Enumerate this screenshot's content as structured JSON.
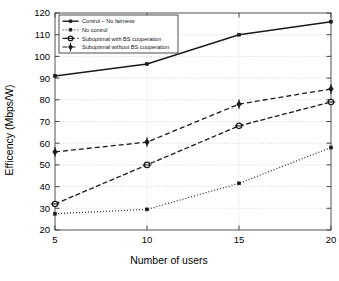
{
  "chart_data": {
    "type": "line",
    "title": "",
    "xlabel": "Number of users",
    "ylabel": "Efficency (Mbps/W)",
    "x": [
      5,
      10,
      15,
      20
    ],
    "xlim": [
      5,
      20
    ],
    "ylim": [
      20,
      120
    ],
    "xticks": [
      "5",
      "10",
      "15",
      "20"
    ],
    "yticks": [
      "20",
      "30",
      "40",
      "50",
      "60",
      "70",
      "80",
      "90",
      "100",
      "110",
      "120"
    ],
    "grid": true,
    "legend_position": "top-left",
    "series": [
      {
        "name": "Control – No fairness",
        "values": [
          91,
          96.5,
          110,
          116
        ],
        "style": "solid",
        "marker": "square",
        "color": "#1a1a1a"
      },
      {
        "name": "No control",
        "values": [
          27.5,
          29.5,
          41.5,
          58
        ],
        "style": "dotted",
        "marker": "square",
        "color": "#1a1a1a"
      },
      {
        "name": "Suboptimal with BS cooperation",
        "values": [
          32,
          50,
          68,
          79
        ],
        "style": "dashdot",
        "marker": "circle",
        "color": "#1a1a1a"
      },
      {
        "name": "Suboptimal without BS cooperation",
        "values": [
          56,
          60.5,
          78,
          85
        ],
        "style": "dashed",
        "marker": "diamond",
        "color": "#1a1a1a"
      }
    ]
  },
  "caption": {
    "text": ""
  }
}
